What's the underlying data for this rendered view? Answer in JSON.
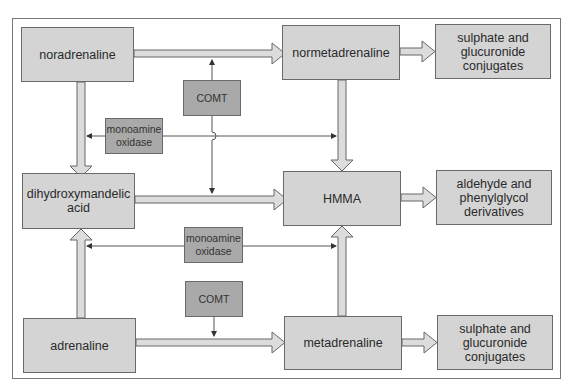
{
  "diagram": {
    "type": "metabolic pathway flowchart",
    "colors": {
      "main_box_fill": "#d4d4d4",
      "enzyme_box_fill": "#a9a9a9",
      "border": "#6a6a6a",
      "arrow_fill": "#dcdcdc",
      "line": "#555555",
      "frame": "#777777"
    },
    "nodes": {
      "noradrenaline": {
        "label": "noradrenaline"
      },
      "normetadrenaline": {
        "label": "normetadrenaline"
      },
      "conjugates_top": {
        "label": "sulphate and\nglucuronide\nconjugates"
      },
      "comt_top": {
        "label": "COMT"
      },
      "mao_top": {
        "label": "monoamine\noxidase"
      },
      "dihydroxymandelic": {
        "label": "dihydroxymandelic\nacid"
      },
      "hmma": {
        "label": "HMMA"
      },
      "aldehyde": {
        "label": "aldehyde and\nphenylglycol\nderivatives"
      },
      "mao_bottom": {
        "label": "monoamine\noxidase"
      },
      "comt_bottom": {
        "label": "COMT"
      },
      "adrenaline": {
        "label": "adrenaline"
      },
      "metadrenaline": {
        "label": "metadrenaline"
      },
      "conjugates_bottom": {
        "label": "sulphate and\nglucuronide\nconjugates"
      }
    },
    "edges": [
      {
        "from": "noradrenaline",
        "to": "normetadrenaline",
        "style": "block-arrow",
        "catalyst": "COMT"
      },
      {
        "from": "noradrenaline",
        "to": "dihydroxymandelic acid",
        "style": "block-arrow",
        "catalyst": "monoamine oxidase"
      },
      {
        "from": "normetadrenaline",
        "to": "sulphate and glucuronide conjugates",
        "style": "block-arrow"
      },
      {
        "from": "normetadrenaline",
        "to": "HMMA",
        "style": "block-arrow",
        "catalyst": "monoamine oxidase"
      },
      {
        "from": "dihydroxymandelic acid",
        "to": "HMMA",
        "style": "block-arrow",
        "catalyst": "COMT"
      },
      {
        "from": "HMMA",
        "to": "aldehyde and phenylglycol derivatives",
        "style": "block-arrow"
      },
      {
        "from": "adrenaline",
        "to": "dihydroxymandelic acid",
        "style": "block-arrow",
        "catalyst": "monoamine oxidase"
      },
      {
        "from": "adrenaline",
        "to": "metadrenaline",
        "style": "block-arrow",
        "catalyst": "COMT"
      },
      {
        "from": "metadrenaline",
        "to": "HMMA",
        "style": "block-arrow",
        "catalyst": "monoamine oxidase"
      },
      {
        "from": "metadrenaline",
        "to": "sulphate and glucuronide conjugates",
        "style": "block-arrow"
      }
    ]
  }
}
